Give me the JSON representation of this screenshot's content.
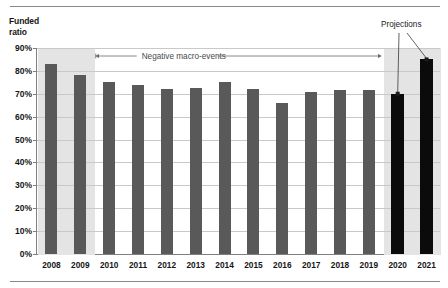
{
  "chart_data": {
    "type": "bar",
    "title": "",
    "ylabel": "Funded ratio",
    "xlabel": "",
    "categories": [
      "2008",
      "2009",
      "2010",
      "2011",
      "2012",
      "2013",
      "2014",
      "2015",
      "2016",
      "2017",
      "2018",
      "2019",
      "2020",
      "2021"
    ],
    "values": [
      83,
      78,
      75,
      74,
      72,
      72.5,
      75,
      72,
      66,
      71,
      71.5,
      71.5,
      70,
      85
    ],
    "series": [
      {
        "name": "Funded ratio",
        "values": [
          83,
          78,
          75,
          74,
          72,
          72.5,
          75,
          72,
          66,
          71,
          71.5,
          71.5,
          70,
          85
        ]
      }
    ],
    "ylim": [
      0,
      90
    ],
    "ytick_labels": [
      "0%",
      "10%",
      "20%",
      "30%",
      "40%",
      "50%",
      "60%",
      "70%",
      "80%",
      "90%"
    ],
    "ytick_values": [
      0,
      10,
      20,
      30,
      40,
      50,
      60,
      70,
      80,
      90
    ],
    "grid": true,
    "legend_position": "none",
    "bar_colors": {
      "actual": "#595959",
      "projection": "#0b0b0b"
    },
    "shaded_bands": [
      {
        "name": "crisis-band",
        "from": "2008",
        "to": "2009",
        "color": "#e4e4e4"
      },
      {
        "name": "projection-band",
        "from": "2020",
        "to": "2021",
        "color": "#e4e4e4"
      }
    ],
    "annotations": [
      {
        "name": "negative-macro-events",
        "text": "Negative macro-events",
        "style": "double-headed-arrow"
      },
      {
        "name": "projections",
        "text": "Projections",
        "style": "leader-lines",
        "points_to": [
          "2020",
          "2021"
        ]
      }
    ]
  },
  "axis": {
    "y_title_line1": "Funded",
    "y_title_line2": "ratio"
  },
  "colors": {
    "bar_actual": "#595959",
    "bar_projection": "#0b0b0b",
    "band": "#e4e4e4",
    "gridline": "#c9c9c9",
    "axis": "#7f7f7f",
    "rule": "#8a8a8a",
    "text": "#161616",
    "annotation_text": "#4a4a4a"
  }
}
